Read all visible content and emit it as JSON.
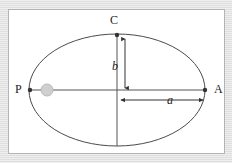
{
  "figure": {
    "kind": "ellipse-orbit-geometry-diagram",
    "panel": {
      "background_color": "#ffffff",
      "border_color": "#b4b4b4",
      "outer_background_color": "#e2e2e2"
    },
    "ellipse": {
      "center": {
        "x": 108,
        "y": 80
      },
      "semi_major_axis_px": 88,
      "semi_minor_axis_px": 56,
      "stroke_color": "#4a4a4a",
      "stroke_width": 1
    },
    "points": [
      {
        "id": "P",
        "label": "P",
        "x": 21,
        "y": 80,
        "marker": "dot",
        "marker_color": "#333333"
      },
      {
        "id": "A",
        "label": "A",
        "x": 196,
        "y": 80,
        "marker": "dot",
        "marker_color": "#333333"
      },
      {
        "id": "C",
        "label": "C",
        "x": 108,
        "y": 25,
        "marker": "dot",
        "marker_color": "#333333"
      }
    ],
    "focus_body": {
      "name": "focus-star",
      "x": 38,
      "y": 80,
      "radius_px": 6,
      "fill_color": "#cfcfcf",
      "stroke_color": "#b0b0b0"
    },
    "axes": [
      {
        "id": "major-axis-line",
        "label": "",
        "orientation": "horizontal",
        "from": {
          "x": 21,
          "y": 80
        },
        "to": {
          "x": 196,
          "y": 80
        },
        "stroke_color": "#555555"
      },
      {
        "id": "minor-axis-line",
        "label": "",
        "orientation": "vertical",
        "from": {
          "x": 108,
          "y": 25
        },
        "to": {
          "x": 108,
          "y": 136
        },
        "stroke_color": "#555555"
      }
    ],
    "measures": [
      {
        "id": "semi-minor-measure",
        "label": "b",
        "description": "semi-minor axis from center up to C",
        "orientation": "vertical",
        "from": {
          "x": 116,
          "y": 27
        },
        "to": {
          "x": 116,
          "y": 80
        },
        "arrow": "double",
        "stroke_color": "#333333"
      },
      {
        "id": "semi-major-measure",
        "label": "a",
        "description": "semi-major axis from center right to A",
        "orientation": "horizontal",
        "from": {
          "x": 110,
          "y": 90
        },
        "to": {
          "x": 196,
          "y": 90
        },
        "arrow": "double",
        "stroke_color": "#333333"
      }
    ],
    "labels": {
      "apoapsis_point": "A",
      "periapsis_point": "P",
      "co_vertex_point": "C",
      "semi_major": "a",
      "semi_minor": "b"
    }
  }
}
